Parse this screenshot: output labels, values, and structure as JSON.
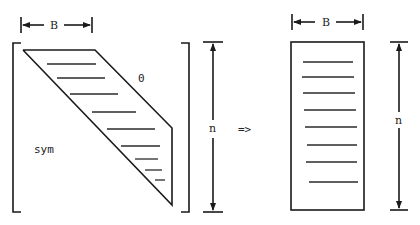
{
  "diagram": {
    "left_matrix": {
      "bandwidth_label": "B",
      "upper_region_label": "0",
      "lower_region_label": "sym",
      "size_label": "n"
    },
    "arrow": {
      "label": "=>"
    },
    "right_matrix": {
      "bandwidth_label": "B",
      "size_label": "n"
    }
  }
}
